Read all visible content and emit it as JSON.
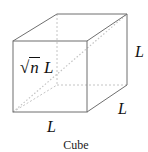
{
  "diagram": {
    "type": "cube",
    "caption": "Cube",
    "labels": {
      "diagonal_radical": "√",
      "diagonal_var": "n",
      "diagonal_len": " L",
      "right_edge": "L",
      "depth_edge": "L",
      "bottom_edge": "L"
    },
    "colors": {
      "visible_edge": "#6f6f6f",
      "hidden_edge": "#c4c4c4",
      "text": "#111111"
    },
    "vertices": {
      "front_top_left": [
        13,
        41
      ],
      "front_top_right": [
        87,
        41
      ],
      "front_bottom_left": [
        13,
        112
      ],
      "front_bottom_right": [
        87,
        112
      ],
      "back_top_left": [
        57,
        14
      ],
      "back_top_right": [
        127,
        14
      ],
      "back_bottom_left": [
        57,
        85
      ],
      "back_bottom_right": [
        127,
        85
      ]
    }
  }
}
